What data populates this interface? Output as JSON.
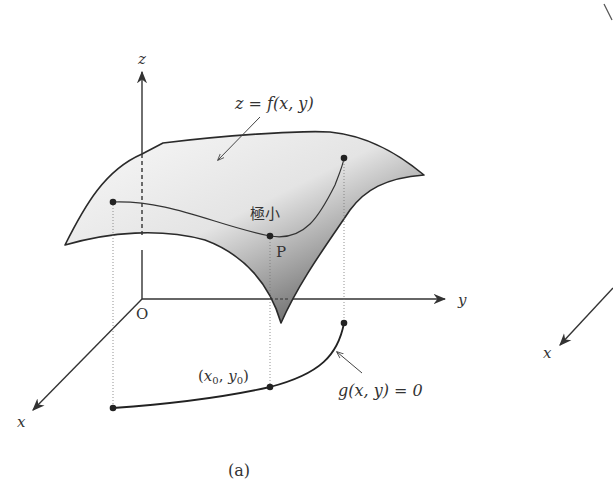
{
  "figure": {
    "caption": "(a)",
    "axes": {
      "z_label": "z",
      "y_label": "y",
      "x_label": "x",
      "origin_label": "O"
    },
    "surface_label": "z = f(x, y)",
    "minimum_label": "極小",
    "point_label": "P",
    "constraint_point_label": "(x0, y0)",
    "constraint_point": {
      "x": "x",
      "sub_x": "0",
      "y": "y",
      "sub_y": "0"
    },
    "constraint_label": "g(x, y) = 0",
    "partial_next_figure": {
      "x_label": "x"
    }
  },
  "colors": {
    "line": "#333333",
    "surface_light": "#f0f0f0",
    "surface_dark": "#7a7a7a",
    "background": "#ffffff"
  }
}
